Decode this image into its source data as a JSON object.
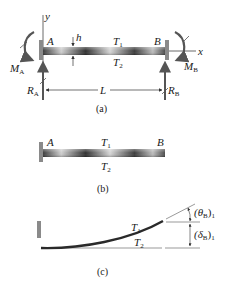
{
  "figure": {
    "part_a": {
      "caption": "(a)",
      "axis_y": "y",
      "axis_x": "x",
      "point_a": "A",
      "point_b": "B",
      "thickness": "h",
      "top_temp": "T",
      "top_temp_sub": "1",
      "bottom_temp": "T",
      "bottom_temp_sub": "2",
      "moment_a": "M",
      "moment_a_sub": "A",
      "moment_b": "M",
      "moment_b_sub": "B",
      "reaction_a": "R",
      "reaction_a_sub": "A",
      "reaction_b": "R",
      "reaction_b_sub": "B",
      "length": "L"
    },
    "part_b": {
      "caption": "(b)",
      "point_a": "A",
      "point_b": "B",
      "top_temp": "T",
      "top_temp_sub": "1",
      "bottom_temp": "T",
      "bottom_temp_sub": "2"
    },
    "part_c": {
      "caption": "(c)",
      "top_temp": "T",
      "top_temp_sub": "1",
      "bottom_temp": "T",
      "bottom_temp_sub": "2",
      "rotation_label": "(θ",
      "rotation_sub": "B",
      "rotation_close": ")",
      "rotation_sub2": "1",
      "deflection_label": "(δ",
      "deflection_sub": "B",
      "deflection_close": ")",
      "deflection_sub2": "1"
    }
  },
  "colors": {
    "beam_dark": "#2a2a2a",
    "beam_light": "#d8d8d8",
    "wall": "#7a7a7a",
    "line": "#333333"
  }
}
